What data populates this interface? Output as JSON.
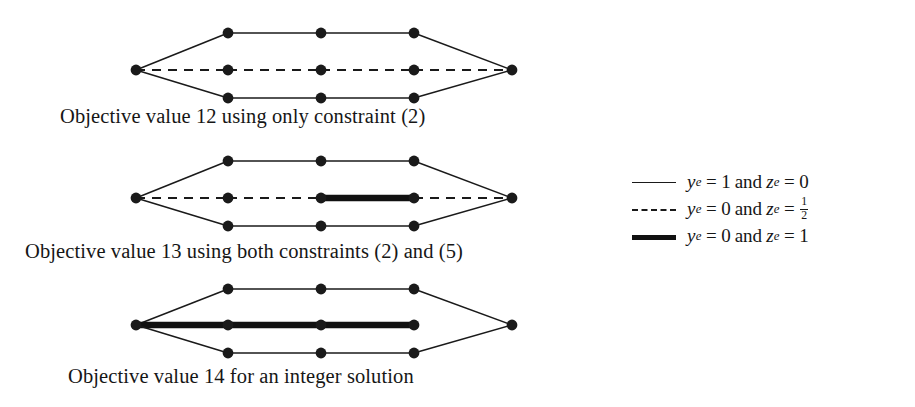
{
  "figure": {
    "background_color": "#ffffff",
    "ink_color": "#1a1a1a",
    "panels": [
      {
        "id": "panel-1",
        "caption": "Objective value 12 using only constraint (2)",
        "objective_value": 12,
        "nodes": [
          {
            "id": "L",
            "x": 136,
            "y": 70
          },
          {
            "id": "T1",
            "x": 228,
            "y": 33
          },
          {
            "id": "T2",
            "x": 321,
            "y": 33
          },
          {
            "id": "T3",
            "x": 414,
            "y": 33
          },
          {
            "id": "M1",
            "x": 228,
            "y": 70
          },
          {
            "id": "M2",
            "x": 321,
            "y": 70
          },
          {
            "id": "M3",
            "x": 414,
            "y": 70
          },
          {
            "id": "B1",
            "x": 228,
            "y": 98
          },
          {
            "id": "B2",
            "x": 321,
            "y": 98
          },
          {
            "id": "B3",
            "x": 414,
            "y": 98
          },
          {
            "id": "R",
            "x": 512,
            "y": 70
          }
        ],
        "edges": [
          {
            "from": "L",
            "to": "T1",
            "style": "solid-thin"
          },
          {
            "from": "T1",
            "to": "T2",
            "style": "solid-thin"
          },
          {
            "from": "T2",
            "to": "T3",
            "style": "solid-thin"
          },
          {
            "from": "T3",
            "to": "R",
            "style": "solid-thin"
          },
          {
            "from": "L",
            "to": "M1",
            "style": "dashed"
          },
          {
            "from": "M1",
            "to": "M2",
            "style": "dashed"
          },
          {
            "from": "M2",
            "to": "M3",
            "style": "dashed"
          },
          {
            "from": "M3",
            "to": "R",
            "style": "dashed"
          },
          {
            "from": "L",
            "to": "B1",
            "style": "solid-thin"
          },
          {
            "from": "B1",
            "to": "B2",
            "style": "solid-thin"
          },
          {
            "from": "B2",
            "to": "B3",
            "style": "solid-thin"
          },
          {
            "from": "B3",
            "to": "R",
            "style": "solid-thin"
          }
        ]
      },
      {
        "id": "panel-2",
        "caption": "Objective value 13 using both constraints (2) and (5)",
        "objective_value": 13,
        "nodes": [
          {
            "id": "L",
            "x": 136,
            "y": 198
          },
          {
            "id": "T1",
            "x": 228,
            "y": 161
          },
          {
            "id": "T2",
            "x": 321,
            "y": 161
          },
          {
            "id": "T3",
            "x": 414,
            "y": 161
          },
          {
            "id": "M1",
            "x": 228,
            "y": 198
          },
          {
            "id": "M2",
            "x": 321,
            "y": 198
          },
          {
            "id": "M3",
            "x": 414,
            "y": 198
          },
          {
            "id": "B1",
            "x": 228,
            "y": 226
          },
          {
            "id": "B2",
            "x": 321,
            "y": 226
          },
          {
            "id": "B3",
            "x": 414,
            "y": 226
          },
          {
            "id": "R",
            "x": 512,
            "y": 198
          }
        ],
        "edges": [
          {
            "from": "L",
            "to": "T1",
            "style": "solid-thin"
          },
          {
            "from": "T1",
            "to": "T2",
            "style": "solid-thin"
          },
          {
            "from": "T2",
            "to": "T3",
            "style": "solid-thin"
          },
          {
            "from": "T3",
            "to": "R",
            "style": "solid-thin"
          },
          {
            "from": "L",
            "to": "M1",
            "style": "dashed"
          },
          {
            "from": "M1",
            "to": "M2",
            "style": "dashed"
          },
          {
            "from": "M2",
            "to": "M3",
            "style": "solid-thick"
          },
          {
            "from": "M3",
            "to": "R",
            "style": "dashed"
          },
          {
            "from": "L",
            "to": "B1",
            "style": "solid-thin"
          },
          {
            "from": "B1",
            "to": "B2",
            "style": "solid-thin"
          },
          {
            "from": "B2",
            "to": "B3",
            "style": "solid-thin"
          },
          {
            "from": "B3",
            "to": "R",
            "style": "solid-thin"
          }
        ]
      },
      {
        "id": "panel-3",
        "caption": "Objective value 14 for an integer solution",
        "objective_value": 14,
        "nodes": [
          {
            "id": "L",
            "x": 136,
            "y": 325
          },
          {
            "id": "T1",
            "x": 228,
            "y": 289
          },
          {
            "id": "T2",
            "x": 321,
            "y": 289
          },
          {
            "id": "T3",
            "x": 414,
            "y": 289
          },
          {
            "id": "M1",
            "x": 228,
            "y": 325
          },
          {
            "id": "M2",
            "x": 321,
            "y": 325
          },
          {
            "id": "M3",
            "x": 414,
            "y": 325
          },
          {
            "id": "B1",
            "x": 228,
            "y": 353
          },
          {
            "id": "B2",
            "x": 321,
            "y": 353
          },
          {
            "id": "B3",
            "x": 414,
            "y": 353
          },
          {
            "id": "R",
            "x": 512,
            "y": 325
          }
        ],
        "edges": [
          {
            "from": "L",
            "to": "T1",
            "style": "solid-thin"
          },
          {
            "from": "T1",
            "to": "T2",
            "style": "solid-thin"
          },
          {
            "from": "T2",
            "to": "T3",
            "style": "solid-thin"
          },
          {
            "from": "T3",
            "to": "R",
            "style": "solid-thin"
          },
          {
            "from": "L",
            "to": "M1",
            "style": "solid-thick"
          },
          {
            "from": "M1",
            "to": "M2",
            "style": "solid-thick"
          },
          {
            "from": "M2",
            "to": "M3",
            "style": "solid-thick"
          },
          {
            "from": "L",
            "to": "B1",
            "style": "solid-thin"
          },
          {
            "from": "B1",
            "to": "B2",
            "style": "solid-thin"
          },
          {
            "from": "B2",
            "to": "B3",
            "style": "solid-thin"
          },
          {
            "from": "B3",
            "to": "R",
            "style": "solid-thin"
          }
        ]
      }
    ]
  },
  "legend": {
    "entries": [
      {
        "style": "solid-thin",
        "y_var": "y",
        "y_sub": "e",
        "y_value": "1",
        "conj": "and",
        "z_var": "z",
        "z_sub": "e",
        "z_value": "0",
        "z_is_fraction": false,
        "text": "y_e = 1 and z_e = 0"
      },
      {
        "style": "dashed",
        "y_var": "y",
        "y_sub": "e",
        "y_value": "0",
        "conj": "and",
        "z_var": "z",
        "z_sub": "e",
        "z_value": "",
        "z_is_fraction": true,
        "z_num": "1",
        "z_den": "2",
        "text": "y_e = 0 and z_e = 1/2"
      },
      {
        "style": "solid-thick",
        "y_var": "y",
        "y_sub": "e",
        "y_value": "0",
        "conj": "and",
        "z_var": "z",
        "z_sub": "e",
        "z_value": "1",
        "z_is_fraction": false,
        "text": "y_e = 0 and z_e = 1"
      }
    ],
    "equals": "=",
    "sample_width_px": 48
  }
}
